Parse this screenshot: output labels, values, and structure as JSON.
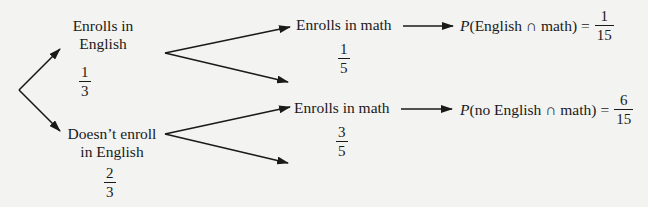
{
  "diagram": {
    "type": "probability tree",
    "root": {
      "branches": [
        {
          "label_line1": "Enrolls in",
          "label_line2": "English",
          "probability": {
            "num": "1",
            "den": "3"
          },
          "children": [
            {
              "label": "Enrolls in math",
              "probability": {
                "num": "1",
                "den": "5"
              },
              "result": {
                "prefix": "P",
                "expression": "(English ∩ math)",
                "equals": "=",
                "value": {
                  "num": "1",
                  "den": "15"
                }
              }
            },
            {
              "label": "",
              "probability": null
            }
          ]
        },
        {
          "label_line1": "Doesn’t enroll",
          "label_line2": "in English",
          "probability": {
            "num": "2",
            "den": "3"
          },
          "children": [
            {
              "label": "Enrolls in math",
              "probability": {
                "num": "3",
                "den": "5"
              },
              "result": {
                "prefix": "P",
                "expression": "(no English ∩ math)",
                "equals": "=",
                "value": {
                  "num": "6",
                  "den": "15"
                }
              }
            },
            {
              "label": "",
              "probability": null
            }
          ]
        }
      ]
    },
    "colors": {
      "background": "#f3f3f1",
      "ink": "#1a1a1a"
    }
  }
}
